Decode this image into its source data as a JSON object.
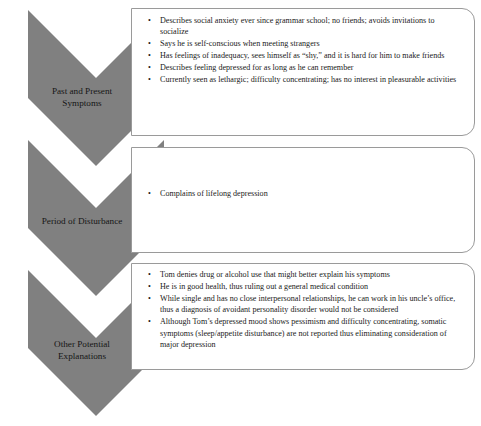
{
  "diagram": {
    "colors": {
      "chevron_fill": "#808080",
      "box_border": "#9a9a9a",
      "background": "#ffffff",
      "text": "#1a1a1a"
    },
    "bullet_glyph": "•",
    "sections": [
      {
        "label_lines": [
          "Past and Present",
          "Symptoms"
        ],
        "label_text": "Past and Present Symptoms",
        "bullets": [
          "Describes social anxiety ever since grammar school; no friends; avoids invitations to socialize",
          "Says he is self-conscious when meeting strangers",
          "Has feelings of inadequacy, sees himself as “shy,” and it is hard for him to make friends",
          "Describes feeling depressed for as long as he can remember",
          "Currently seen as lethargic; difficulty concentrating; has no interest in pleasurable activities"
        ]
      },
      {
        "label_lines": [
          "Period of Disturbance"
        ],
        "label_text": "Period of Disturbance",
        "bullets": [
          "Complains of lifelong depression"
        ]
      },
      {
        "label_lines": [
          "Other Potential",
          "Explanations"
        ],
        "label_text": "Other Potential Explanations",
        "bullets": [
          "Tom denies drug or alcohol use that might better explain his symptoms",
          "He is in good health, thus ruling out a general medical condition",
          "While single and has no close interpersonal relationships, he can work in his uncle’s office, thus a diagnosis of avoidant personality disorder would not be considered",
          "Although Tom’s depressed mood shows pessimism and difficulty concentrating, somatic symptoms (sleep/appetite disturbance) are not reported thus eliminating consideration of major depression"
        ]
      }
    ]
  }
}
